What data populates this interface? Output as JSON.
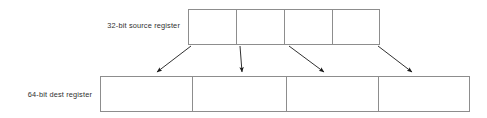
{
  "diagram": {
    "labels": {
      "source": "32-bit source register",
      "dest": "64-bit dest register"
    },
    "colors": {
      "box_border": "#8d8d8d",
      "text": "#2f2f2f",
      "arrow": "#1a1a1a",
      "background": "#ffffff"
    },
    "source_register": {
      "label": "32-bit source register",
      "cell_count": 4,
      "cells": [
        {
          "index": 0,
          "value": ""
        },
        {
          "index": 1,
          "value": ""
        },
        {
          "index": 2,
          "value": ""
        },
        {
          "index": 3,
          "value": ""
        }
      ],
      "geometry": {
        "x": 188,
        "y": 9,
        "width": 192,
        "height": 36
      }
    },
    "dest_register": {
      "label": "64-bit dest register",
      "cell_count": 4,
      "cells": [
        {
          "index": 0,
          "value": ""
        },
        {
          "index": 1,
          "value": ""
        },
        {
          "index": 2,
          "value": ""
        },
        {
          "index": 3,
          "value": ""
        }
      ],
      "geometry": {
        "x": 100,
        "y": 76,
        "width": 370,
        "height": 36
      }
    },
    "arrows": [
      {
        "index": 0,
        "from_x": 191,
        "from_y": 46,
        "to_x": 157,
        "to_y": 72,
        "direction": "down-left"
      },
      {
        "index": 1,
        "from_x": 240,
        "from_y": 46,
        "to_x": 242,
        "to_y": 72,
        "direction": "down"
      },
      {
        "index": 2,
        "from_x": 289,
        "from_y": 46,
        "to_x": 324,
        "to_y": 72,
        "direction": "down-right"
      },
      {
        "index": 3,
        "from_x": 378,
        "from_y": 46,
        "to_x": 412,
        "to_y": 72,
        "direction": "down-right"
      }
    ]
  }
}
